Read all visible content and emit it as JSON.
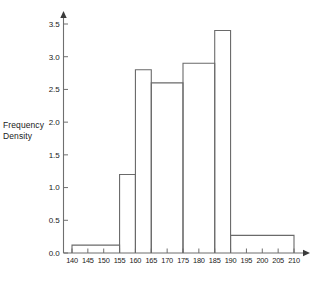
{
  "chart_data": {
    "type": "bar",
    "title": "",
    "subtitle": "",
    "xlabel": "",
    "ylabel": "Frequency Density",
    "ylabel_lines": [
      "Frequency",
      "Density"
    ],
    "xlim": [
      138,
      212
    ],
    "ylim": [
      0,
      3.6
    ],
    "grid": false,
    "legend": null,
    "legend_position": "none",
    "x_ticks": [
      140,
      145,
      150,
      155,
      160,
      165,
      170,
      175,
      180,
      185,
      190,
      195,
      200,
      205,
      210
    ],
    "x_tick_labels": [
      "140",
      "145",
      "150",
      "155",
      "160",
      "165",
      "170",
      "175",
      "180",
      "185",
      "190",
      "195",
      "200",
      "205",
      "210"
    ],
    "y_ticks": [
      0.0,
      0.5,
      1.0,
      1.5,
      2.0,
      2.5,
      3.0,
      3.5
    ],
    "y_tick_labels": [
      "0.0",
      "0.5",
      "1.0",
      "1.5",
      "2.0",
      "2.5",
      "3.0",
      "3.5"
    ],
    "bin_edges": [
      140,
      155,
      160,
      165,
      175,
      185,
      190,
      210
    ],
    "values": [
      0.12,
      1.2,
      2.8,
      2.6,
      2.9,
      3.4,
      0.27
    ],
    "bins": [
      {
        "from": 140,
        "to": 155,
        "density": 0.12
      },
      {
        "from": 155,
        "to": 160,
        "density": 1.2
      },
      {
        "from": 160,
        "to": 165,
        "density": 2.8
      },
      {
        "from": 165,
        "to": 175,
        "density": 2.6
      },
      {
        "from": 175,
        "to": 185,
        "density": 2.9
      },
      {
        "from": 185,
        "to": 190,
        "density": 3.4
      },
      {
        "from": 190,
        "to": 210,
        "density": 0.27
      }
    ],
    "bar_style": {
      "fill": "none",
      "stroke": "#6a6a6a"
    },
    "axis_color": "#6f6f6f",
    "text_color": "#1a1a1a",
    "background": "#ffffff",
    "axis_arrows": [
      "x-right",
      "y-up"
    ]
  }
}
